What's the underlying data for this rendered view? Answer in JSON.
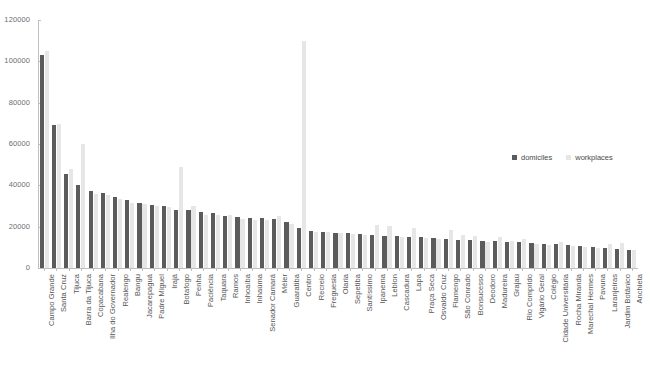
{
  "chart_data": {
    "type": "bar",
    "title": "",
    "subtitle": "",
    "xlabel": "",
    "ylabel": "",
    "ylim": [
      0,
      120000
    ],
    "ytick_labels": [
      "0",
      "20000",
      "40000",
      "60000",
      "80000",
      "100000",
      "120000"
    ],
    "ytick_values": [
      0,
      20000,
      40000,
      60000,
      80000,
      100000,
      120000
    ],
    "grid": false,
    "legend_position": "right-middle",
    "colors": {
      "domiciles": "#5b5b5b",
      "workplaces": "#e6e6e6",
      "axis": "#bfbfbf",
      "tick_text": "#6e6e6e",
      "label_text": "#555555"
    },
    "categories": [
      "Campo Grande",
      "Santa Cruz",
      "Tijuca",
      "Barra da Tijuca",
      "Copacabana",
      "Ilha do Governador",
      "Realengo",
      "Bangu",
      "Jacarepaguá",
      "Padre Miguel",
      "Irajá",
      "Botafogo",
      "Penha",
      "Paciência",
      "Taquara",
      "Ramos",
      "Inhoaíba",
      "Inhaúma",
      "Senador Camará",
      "Méier",
      "Guaratiba",
      "Centro",
      "Recreio",
      "Freguesia",
      "Olaria",
      "Sepetiba",
      "Santíssimo",
      "Ipanema",
      "Leblon",
      "Cascadura",
      "Lapa",
      "Praça Seca",
      "Osvaldo Cruz",
      "Flamengo",
      "São Conrado",
      "Bonsucesso",
      "Deodoro",
      "Madureira",
      "Grajaú",
      "Rio Comprido",
      "Vigário Geral",
      "Colégio",
      "Cidade Universitária",
      "Rocha Miranda",
      "Marechal Hermes",
      "Pavuna",
      "Laranjeiras",
      "Jardim Botânico",
      "Anchieta"
    ],
    "series": [
      {
        "name": "domiciles",
        "values": [
          103000,
          69000,
          45500,
          40000,
          37500,
          36500,
          34500,
          33000,
          31500,
          30500,
          30000,
          28000,
          28000,
          27000,
          26500,
          25000,
          24500,
          24000,
          24000,
          23500,
          22500,
          19500,
          18000,
          17500,
          17000,
          17000,
          16500,
          16000,
          15500,
          15500,
          15000,
          15000,
          14500,
          14000,
          13500,
          13500,
          13000,
          13000,
          12500,
          12500,
          12000,
          11500,
          11500,
          11000,
          10500,
          10000,
          9500,
          9000,
          8500
        ]
      },
      {
        "name": "workplaces",
        "values": [
          105000,
          69500,
          48000,
          60000,
          36000,
          35500,
          33500,
          31500,
          31000,
          30000,
          29500,
          49000,
          30000,
          25500,
          25500,
          25500,
          23500,
          23000,
          23000,
          25000,
          21500,
          110000,
          17500,
          17500,
          17000,
          16500,
          16000,
          21000,
          20500,
          15000,
          19500,
          14500,
          14000,
          18500,
          16000,
          15500,
          12500,
          15000,
          13000,
          14000,
          11500,
          11000,
          12500,
          10500,
          10000,
          9500,
          11500,
          12000,
          8500
        ]
      }
    ]
  },
  "legend": {
    "items": [
      {
        "label": "domiciles",
        "key": "domiciles"
      },
      {
        "label": "workplaces",
        "key": "workplaces"
      }
    ]
  }
}
